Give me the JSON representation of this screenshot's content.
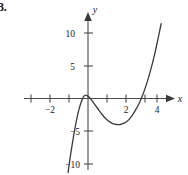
{
  "figure": {
    "problem_number": "3.",
    "background_color": "#ffffff",
    "ink_color": "#3a3a3a"
  },
  "chart_data": {
    "type": "line",
    "title": "",
    "xlabel": "x",
    "ylabel": "y",
    "xlim": [
      -3.2,
      5.1
    ],
    "ylim": [
      -11.5,
      11.8
    ],
    "grid": false,
    "legend": null,
    "x_ticks": [
      -3,
      -2,
      -1,
      1,
      2,
      3,
      4
    ],
    "x_tick_labels": [
      "",
      "−2",
      "",
      "",
      "2",
      "",
      "4"
    ],
    "y_ticks": [
      -10,
      -5,
      5,
      10
    ],
    "y_tick_labels": [
      "−10",
      "−5",
      "5",
      "10"
    ],
    "axis_x_label": "x",
    "axis_y_label": "y",
    "series": [
      {
        "name": "cubic",
        "comment": "smooth cubic-like curve, local max near x=-0.15 (y=0.5), local min near x=1.6 (y=-4), x-intercept near x=3",
        "x": [
          -1.05,
          -0.95,
          -0.85,
          -0.75,
          -0.65,
          -0.55,
          -0.45,
          -0.35,
          -0.25,
          -0.15,
          -0.05,
          0.1,
          0.3,
          0.5,
          0.7,
          0.9,
          1.1,
          1.3,
          1.5,
          1.7,
          1.9,
          2.1,
          2.3,
          2.5,
          2.7,
          2.9,
          3.1,
          3.3,
          3.5,
          3.7,
          3.85
        ],
        "y": [
          -11.4,
          -9.3,
          -7.4,
          -5.6,
          -4.0,
          -2.6,
          -1.4,
          -0.5,
          0.2,
          0.5,
          0.45,
          0.1,
          -0.7,
          -1.5,
          -2.3,
          -3.0,
          -3.5,
          -3.85,
          -4.0,
          -4.0,
          -3.8,
          -3.4,
          -2.7,
          -1.8,
          -0.7,
          0.7,
          2.4,
          4.4,
          6.7,
          9.4,
          11.5
        ]
      }
    ],
    "features": {
      "local_max": {
        "x": -0.15,
        "y": 0.5
      },
      "local_min": {
        "x": 1.65,
        "y": -4.0
      },
      "x_intercept": 3.0
    }
  }
}
